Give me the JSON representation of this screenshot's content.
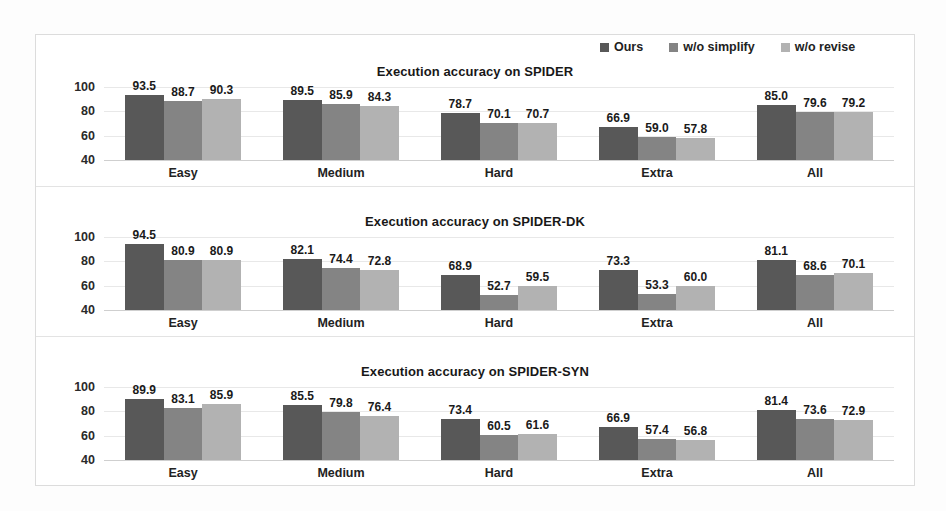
{
  "colors": {
    "ours": "#585858",
    "wo_simplify": "#848484",
    "wo_revise": "#b2b2b2",
    "grid": "#e8e8e8",
    "frame": "#dcdcdc",
    "text": "#1a1a1a",
    "background": "#ffffff"
  },
  "legend": {
    "position": "top-right",
    "items": [
      {
        "label": "Ours",
        "color": "#585858",
        "swatch": "legend-swatch-ours"
      },
      {
        "label": "w/o simplify",
        "color": "#848484",
        "swatch": "legend-swatch-wo-simplify"
      },
      {
        "label": "w/o revise",
        "color": "#b2b2b2",
        "swatch": "legend-swatch-wo-revise"
      }
    ]
  },
  "axis": {
    "yticks": [
      "100",
      "80",
      "60",
      "40"
    ],
    "ymin": 40,
    "ymax": 100,
    "grid": true
  },
  "chart_data": [
    {
      "type": "bar",
      "title": "Execution accuracy on SPIDER",
      "xlabel": "",
      "ylabel": "",
      "ylim": [
        40,
        100
      ],
      "yticks": [
        40,
        60,
        80,
        100
      ],
      "grid": true,
      "legend_position": "top-right",
      "categories": [
        "Easy",
        "Medium",
        "Hard",
        "Extra",
        "All"
      ],
      "series": [
        {
          "name": "Ours",
          "color": "#585858",
          "values": [
            93.5,
            89.5,
            78.7,
            66.9,
            85.0
          ]
        },
        {
          "name": "w/o simplify",
          "color": "#848484",
          "values": [
            88.7,
            85.9,
            70.1,
            59.0,
            79.6
          ]
        },
        {
          "name": "w/o revise",
          "color": "#b2b2b2",
          "values": [
            90.3,
            84.3,
            70.7,
            57.8,
            79.2
          ]
        }
      ]
    },
    {
      "type": "bar",
      "title": "Execution accuracy on SPIDER-DK",
      "xlabel": "",
      "ylabel": "",
      "ylim": [
        40,
        100
      ],
      "yticks": [
        40,
        60,
        80,
        100
      ],
      "grid": true,
      "legend_position": "top-right",
      "categories": [
        "Easy",
        "Medium",
        "Hard",
        "Extra",
        "All"
      ],
      "series": [
        {
          "name": "Ours",
          "color": "#585858",
          "values": [
            94.5,
            82.1,
            68.9,
            73.3,
            81.1
          ]
        },
        {
          "name": "w/o simplify",
          "color": "#848484",
          "values": [
            80.9,
            74.4,
            52.7,
            53.3,
            68.6
          ]
        },
        {
          "name": "w/o revise",
          "color": "#b2b2b2",
          "values": [
            80.9,
            72.8,
            59.5,
            60.0,
            70.1
          ]
        }
      ]
    },
    {
      "type": "bar",
      "title": "Execution accuracy on SPIDER-SYN",
      "xlabel": "",
      "ylabel": "",
      "ylim": [
        40,
        100
      ],
      "yticks": [
        40,
        60,
        80,
        100
      ],
      "grid": true,
      "legend_position": "top-right",
      "categories": [
        "Easy",
        "Medium",
        "Hard",
        "Extra",
        "All"
      ],
      "series": [
        {
          "name": "Ours",
          "color": "#585858",
          "values": [
            89.9,
            85.5,
            73.4,
            66.9,
            81.4
          ]
        },
        {
          "name": "w/o simplify",
          "color": "#848484",
          "values": [
            83.1,
            79.8,
            60.5,
            57.4,
            73.6
          ]
        },
        {
          "name": "w/o revise",
          "color": "#b2b2b2",
          "values": [
            85.9,
            76.4,
            61.6,
            56.8,
            72.9
          ]
        }
      ]
    }
  ]
}
